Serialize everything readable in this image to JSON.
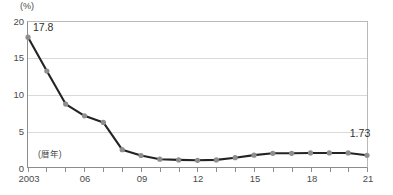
{
  "chart_data": {
    "type": "line",
    "title": "",
    "subtitle": "",
    "xlabel": "(暦年)",
    "ylabel": "(%)",
    "unit": "(%)",
    "x": [
      2003,
      2004,
      2005,
      2006,
      2007,
      2008,
      2009,
      2010,
      2011,
      2012,
      2013,
      2014,
      2015,
      2016,
      2017,
      2018,
      2019,
      2020,
      2021
    ],
    "categories": [
      "2003",
      "2004",
      "2005",
      "2006",
      "2007",
      "2008",
      "2009",
      "2010",
      "2011",
      "2012",
      "2013",
      "2014",
      "2015",
      "2016",
      "2017",
      "2018",
      "2019",
      "2020",
      "2021"
    ],
    "values": [
      17.8,
      13.2,
      8.7,
      7.1,
      6.2,
      2.5,
      1.7,
      1.2,
      1.1,
      1.05,
      1.1,
      1.4,
      1.75,
      2.0,
      2.0,
      2.05,
      2.05,
      2.05,
      1.73
    ],
    "series": [
      {
        "name": "",
        "values": [
          17.8,
          13.2,
          8.7,
          7.1,
          6.2,
          2.5,
          1.7,
          1.2,
          1.1,
          1.05,
          1.1,
          1.4,
          1.75,
          2.0,
          2.0,
          2.05,
          2.05,
          2.05,
          1.73
        ]
      }
    ],
    "ylim": [
      0,
      20
    ],
    "yticks": [
      0,
      5,
      10,
      15,
      20
    ],
    "ytick_labels": [
      "0",
      "5",
      "10",
      "15",
      "20"
    ],
    "xtick_labels": [
      "2003",
      "06",
      "09",
      "12",
      "15",
      "18",
      "21"
    ],
    "xtick_years": [
      2003,
      2006,
      2009,
      2012,
      2015,
      2018,
      2021
    ],
    "grid": true,
    "grid_axis": "y",
    "legend": false,
    "legend_position": "none",
    "annotations": [
      {
        "label": "17.8",
        "x": 2003,
        "y": 17.8,
        "position": "upper-right"
      },
      {
        "label": "1.73",
        "x": 2021,
        "y": 1.73,
        "position": "above"
      }
    ],
    "marker": "circle",
    "marker_color": "#8e8e8e",
    "line_color": "#232323"
  },
  "axis": {
    "unit_label": "(%)",
    "year_caption": "(暦年)"
  },
  "colors": {
    "line": "#232323",
    "marker": "#8e8e8e",
    "grid": "#d9d9d9",
    "axis": "#8d8d8d",
    "text": "#4a4a4a"
  },
  "footnote": {
    "clipped_text": ""
  }
}
